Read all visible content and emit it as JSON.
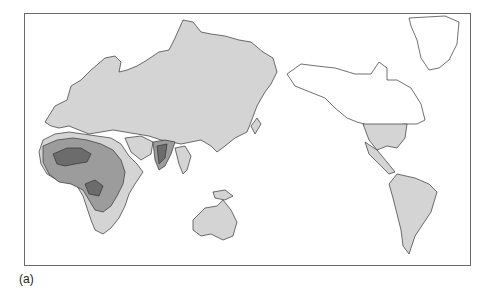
{
  "figure": {
    "caption": "(a)",
    "projection": "Pacific-centered world map",
    "colors": {
      "background": "#ffffff",
      "frame": "#6a6a6a",
      "outline": "#333333",
      "unshaded_land": "#ffffff",
      "light_region": "#d4d4d4",
      "medium_region": "#9c9c9c",
      "dark_region": "#6c6c6c"
    },
    "regions": [
      {
        "name": "Eurasia",
        "shade": "light"
      },
      {
        "name": "Africa",
        "shade": "mixed light/medium/dark"
      },
      {
        "name": "Indian subcontinent",
        "shade": "mixed medium/dark"
      },
      {
        "name": "Southeast Asia",
        "shade": "light"
      },
      {
        "name": "Australia",
        "shade": "light"
      },
      {
        "name": "New Guinea",
        "shade": "light"
      },
      {
        "name": "Southern United States",
        "shade": "light"
      },
      {
        "name": "Central America",
        "shade": "light"
      },
      {
        "name": "South America",
        "shade": "light"
      },
      {
        "name": "Canada and Alaska",
        "shade": "white"
      },
      {
        "name": "Greenland",
        "shade": "white"
      }
    ]
  }
}
